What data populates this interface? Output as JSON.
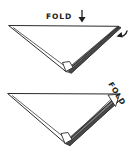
{
  "diagram": {
    "background_color": "#ffffff",
    "ink_color": "#2b2b2b",
    "width": 131,
    "height": 158,
    "style": "hand-drawn pen sketch",
    "steps": [
      {
        "id": "step-1",
        "shape": "downward-pointing triangle",
        "label": "FOLD",
        "label_orientation": "horizontal",
        "label_position": "above top edge, centered-left",
        "arrow": {
          "name": "down-arrow",
          "direction": "down",
          "position": "right of FOLD label"
        },
        "secondary_arrow": {
          "name": "curl-arrow",
          "direction": "counter-clockwise curl",
          "position": "outside top-right corner"
        }
      },
      {
        "id": "step-2",
        "shape": "downward-pointing triangle",
        "label": "FOLD",
        "label_orientation": "diagonal, rotated about 55 degrees",
        "label_position": "outside top-right corner",
        "arrow": {
          "name": "corner-fold-marker",
          "direction": "inward to corner",
          "position": "top-right corner of triangle"
        }
      }
    ],
    "labels": {
      "fold_top": "FOLD",
      "fold_bottom": "FOLD"
    }
  }
}
